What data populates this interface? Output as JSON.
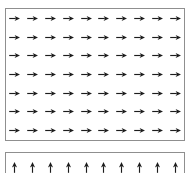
{
  "figure": {
    "title": "",
    "background_color": "#ffffff",
    "border_color": "#8f8f8f",
    "arrow_color": "#1c1c1c"
  },
  "chart_data": {
    "type": "quiver",
    "title": "",
    "subtitle": "",
    "xlabel": "",
    "ylabel": "",
    "grid": false,
    "legend": null,
    "annotations": [],
    "panels": [
      {
        "name": "top-panel",
        "description": "Uniform vector field pointing right (east)",
        "rows": 7,
        "cols": 10,
        "arrow_direction": "right",
        "arrow_angle_deg": 0,
        "arrow_glyph": "→",
        "uniform": true,
        "u": 1,
        "v": 0,
        "magnitude": 1,
        "xlim": [
          0,
          10
        ],
        "ylim": [
          0,
          7
        ],
        "xticks": [],
        "yticks": [],
        "xticklabels": [],
        "yticklabels": []
      },
      {
        "name": "bottom-panel",
        "description": "Uniform vector field pointing up (north), panel clipped by figure edge",
        "rows": 1,
        "cols": 10,
        "arrow_direction": "up",
        "arrow_angle_deg": 90,
        "arrow_glyph": "↑",
        "uniform": true,
        "u": 0,
        "v": 1,
        "magnitude": 1,
        "xlim": [
          0,
          10
        ],
        "ylim": [
          0,
          1
        ],
        "xticks": [],
        "yticks": [],
        "xticklabels": [],
        "yticklabels": []
      }
    ]
  }
}
